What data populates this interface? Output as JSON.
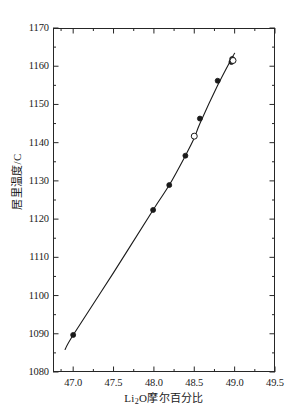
{
  "chart_data": {
    "type": "scatter",
    "title": "",
    "subtitle": "",
    "xlabel_parts": {
      "pre": "Li",
      "sub": "2",
      "post": "O摩尔百分比"
    },
    "xlabel": "Li2O摩尔百分比",
    "ylabel": "居里温度/C",
    "xlim": [
      46.75,
      49.5
    ],
    "ylim": [
      1080,
      1170
    ],
    "xticks": [
      47.0,
      47.5,
      48.0,
      48.5,
      49.0,
      49.5
    ],
    "xtick_labels": [
      "47.0",
      "47.5",
      "48.0",
      "48.5",
      "49.0",
      "49.5"
    ],
    "yticks": [
      1080,
      1090,
      1100,
      1110,
      1120,
      1130,
      1140,
      1150,
      1160,
      1170
    ],
    "ytick_labels": [
      "1080",
      "1090",
      "1100",
      "1110",
      "1120",
      "1130",
      "1140",
      "1150",
      "1160",
      "1170"
    ],
    "x_minor_ticks": [
      46.85,
      47.25,
      47.75,
      48.25,
      48.75,
      49.25
    ],
    "y_minor_ticks": [
      1085,
      1095,
      1105,
      1115,
      1125,
      1135,
      1145,
      1155,
      1165
    ],
    "grid": false,
    "legend": false,
    "legend_position": "none",
    "tick_direction": "in",
    "frame": "box",
    "line_color": "#1a1a1a",
    "marker_color": "#1a1a1a",
    "background_color": "#ffffff",
    "series": [
      {
        "name": "filled",
        "marker": "filled-circle",
        "points": [
          {
            "x": 47.0,
            "y": 1089.7
          },
          {
            "x": 47.99,
            "y": 1122.4
          },
          {
            "x": 48.19,
            "y": 1128.9
          },
          {
            "x": 48.39,
            "y": 1136.6
          },
          {
            "x": 48.57,
            "y": 1146.3
          },
          {
            "x": 48.79,
            "y": 1156.2
          },
          {
            "x": 48.97,
            "y": 1161.9
          },
          {
            "x": 48.96,
            "y": 1161.1
          }
        ]
      },
      {
        "name": "open",
        "marker": "open-circle",
        "points": [
          {
            "x": 48.5,
            "y": 1141.7
          },
          {
            "x": 48.98,
            "y": 1161.5
          }
        ]
      }
    ],
    "fit_line": {
      "name": "trend-line",
      "style": "solid",
      "points": [
        {
          "x": 46.9,
          "y": 1085.9
        },
        {
          "x": 47.0,
          "y": 1089.7
        },
        {
          "x": 47.5,
          "y": 1106.0
        },
        {
          "x": 47.99,
          "y": 1122.4
        },
        {
          "x": 48.19,
          "y": 1128.9
        },
        {
          "x": 48.39,
          "y": 1136.6
        },
        {
          "x": 48.5,
          "y": 1141.2
        },
        {
          "x": 48.57,
          "y": 1145.0
        },
        {
          "x": 48.79,
          "y": 1155.0
        },
        {
          "x": 48.97,
          "y": 1162.3
        },
        {
          "x": 49.0,
          "y": 1163.4
        }
      ]
    }
  }
}
